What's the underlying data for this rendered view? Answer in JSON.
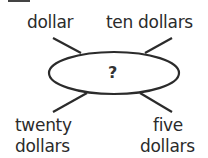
{
  "diagram": {
    "type": "concept-web",
    "center": {
      "label": "?"
    },
    "spokes": [
      {
        "position": "top-left",
        "label": "dollar"
      },
      {
        "position": "top-right",
        "label": "ten dollars"
      },
      {
        "position": "bottom-left",
        "label_line1": "twenty",
        "label_line2": "dollars"
      },
      {
        "position": "bottom-right",
        "label_line1": "five",
        "label_line2": "dollars"
      }
    ],
    "colors": {
      "ink": "#2b2b2b",
      "background": "#ffffff"
    }
  }
}
